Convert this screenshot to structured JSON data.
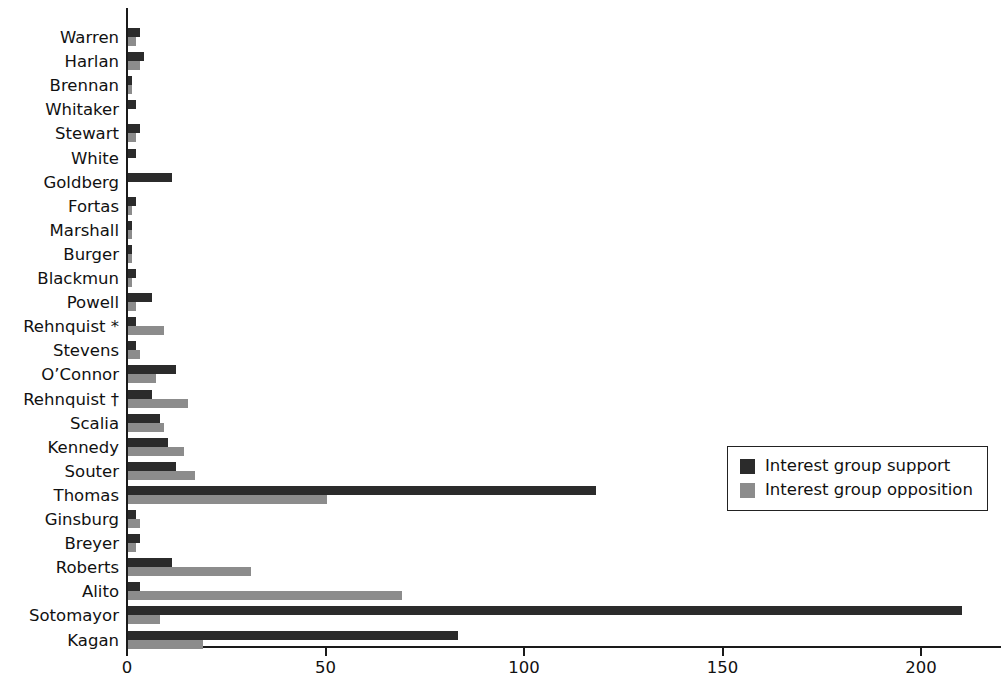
{
  "chart_data": {
    "type": "bar",
    "orientation": "horizontal",
    "title": "",
    "subtitle": "",
    "xlabel": "",
    "ylabel": "",
    "xlim": [
      0,
      220
    ],
    "xticks": [
      0,
      50,
      100,
      150,
      200
    ],
    "xtick_labels": [
      "0",
      "50",
      "100",
      "150",
      "200"
    ],
    "grid": false,
    "legend_position": "center-right",
    "categories": [
      "Warren",
      "Harlan",
      "Brennan",
      "Whitaker",
      "Stewart",
      "White",
      "Goldberg",
      "Fortas",
      "Marshall",
      "Burger",
      "Blackmun",
      "Powell",
      "Rehnquist *",
      "Stevens",
      "O’Connor",
      "Rehnquist †",
      "Scalia",
      "Kennedy",
      "Souter",
      "Thomas",
      "Ginsburg",
      "Breyer",
      "Roberts",
      "Alito",
      "Sotomayor",
      "Kagan"
    ],
    "series": [
      {
        "name": "Interest group support",
        "color": "#2b2b2b",
        "values": [
          3,
          4,
          1,
          2,
          3,
          2,
          11,
          2,
          1,
          1,
          2,
          6,
          2,
          2,
          12,
          6,
          8,
          10,
          12,
          118,
          2,
          3,
          11,
          3,
          210,
          83
        ]
      },
      {
        "name": "Interest group opposition",
        "color": "#8c8c8c",
        "values": [
          2,
          3,
          1,
          0,
          2,
          0,
          0,
          1,
          1,
          1,
          1,
          2,
          9,
          3,
          7,
          15,
          9,
          14,
          17,
          50,
          3,
          2,
          31,
          69,
          8,
          19
        ]
      }
    ]
  },
  "legend": {
    "items": [
      {
        "label": "Interest group support",
        "swatch": "support"
      },
      {
        "label": "Interest group opposition",
        "swatch": "opposition"
      }
    ]
  }
}
